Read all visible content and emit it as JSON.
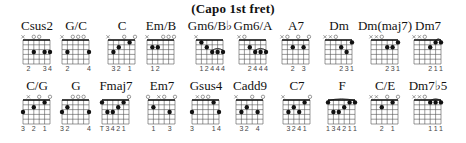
{
  "title": "(Capo 1st fret)",
  "layout": {
    "col_start_x": 16,
    "col_spacing": 33.6
  },
  "rows": [
    {
      "chords": [
        {
          "name": "Csus2",
          "top": [
            "x",
            "",
            "o",
            "o",
            "",
            ""
          ],
          "dots": [
            [
              2,
              3
            ],
            [
              4,
              3
            ],
            [
              5,
              3
            ]
          ],
          "barres": [],
          "fingers": [
            "",
            "2",
            "",
            "",
            "3",
            "4"
          ]
        },
        {
          "name": "G/C",
          "top": [
            "x",
            "",
            "o",
            "o",
            "o",
            ""
          ],
          "dots": [
            [
              1,
              3
            ],
            [
              5,
              3
            ]
          ],
          "barres": [],
          "fingers": [
            "",
            "2",
            "",
            "",
            "",
            "4"
          ]
        },
        {
          "name": "C",
          "top": [
            "x",
            "",
            "",
            "o",
            "",
            "o"
          ],
          "dots": [
            [
              1,
              3
            ],
            [
              2,
              2
            ],
            [
              4,
              1
            ]
          ],
          "barres": [],
          "fingers": [
            "",
            "3",
            "2",
            "",
            "1",
            ""
          ]
        },
        {
          "name": "Em/B",
          "top": [
            "x",
            "",
            "",
            "o",
            "o",
            "o"
          ],
          "dots": [
            [
              1,
              2
            ],
            [
              2,
              2
            ]
          ],
          "barres": [],
          "fingers": [
            "",
            "1",
            "2",
            "",
            "",
            ""
          ]
        },
        {
          "name": "Gm6/B♭",
          "top": [
            "x",
            "",
            "",
            "",
            "",
            ""
          ],
          "dots": [
            [
              1,
              1
            ],
            [
              2,
              2
            ],
            [
              3,
              3
            ],
            [
              4,
              3
            ],
            [
              5,
              3
            ]
          ],
          "barres": [
            [
              3,
              5,
              3
            ]
          ],
          "fingers": [
            "",
            "1",
            "2",
            "4",
            "4",
            "4"
          ]
        },
        {
          "name": "Gm6/A",
          "top": [
            "x",
            "o",
            "",
            "",
            "",
            ""
          ],
          "dots": [
            [
              2,
              2
            ],
            [
              3,
              3
            ],
            [
              4,
              3
            ],
            [
              5,
              3
            ]
          ],
          "barres": [
            [
              3,
              5,
              3
            ]
          ],
          "fingers": [
            "",
            "",
            "2",
            "4",
            "4",
            "4"
          ]
        },
        {
          "name": "A7",
          "top": [
            "x",
            "o",
            "",
            "o",
            "",
            "o"
          ],
          "dots": [
            [
              2,
              2
            ],
            [
              4,
              2
            ]
          ],
          "barres": [],
          "fingers": [
            "",
            "",
            "2",
            "",
            "3",
            ""
          ]
        },
        {
          "name": "Dm",
          "top": [
            "x",
            "x",
            "o",
            "",
            "",
            ""
          ],
          "dots": [
            [
              3,
              2
            ],
            [
              4,
              3
            ],
            [
              5,
              1
            ]
          ],
          "barres": [],
          "fingers": [
            "",
            "",
            "",
            "2",
            "3",
            "1"
          ]
        },
        {
          "name": "Dm(maj7)",
          "top": [
            "x",
            "x",
            "o",
            "",
            "",
            ""
          ],
          "dots": [
            [
              3,
              2
            ],
            [
              4,
              2
            ],
            [
              5,
              1
            ]
          ],
          "barres": [],
          "fingers": [
            "",
            "",
            "",
            "2",
            "3",
            "1"
          ]
        },
        {
          "name": "Dm7",
          "top": [
            "x",
            "x",
            "o",
            "",
            "",
            ""
          ],
          "dots": [
            [
              3,
              2
            ],
            [
              4,
              1
            ],
            [
              5,
              1
            ]
          ],
          "barres": [
            [
              4,
              5,
              1
            ]
          ],
          "fingers": [
            "",
            "",
            "",
            "2",
            "1",
            "1"
          ]
        }
      ]
    },
    {
      "chords": [
        {
          "name": "C/G",
          "top": [
            "",
            "x",
            "",
            "o",
            "",
            "o"
          ],
          "dots": [
            [
              0,
              3
            ],
            [
              2,
              2
            ],
            [
              4,
              1
            ]
          ],
          "barres": [],
          "fingers": [
            "3",
            "",
            "2",
            "",
            "1",
            ""
          ]
        },
        {
          "name": "G",
          "top": [
            "",
            "",
            "o",
            "o",
            "o",
            ""
          ],
          "dots": [
            [
              0,
              3
            ],
            [
              1,
              2
            ],
            [
              5,
              3
            ]
          ],
          "barres": [],
          "fingers": [
            "3",
            "2",
            "",
            "",
            "",
            "4"
          ]
        },
        {
          "name": "Fmaj7",
          "top": [
            "",
            "",
            "",
            "",
            "",
            "o"
          ],
          "dots": [
            [
              0,
              1
            ],
            [
              1,
              3
            ],
            [
              2,
              3
            ],
            [
              3,
              2
            ],
            [
              4,
              1
            ]
          ],
          "barres": [],
          "fingers": [
            "T",
            "3",
            "4",
            "2",
            "1",
            ""
          ]
        },
        {
          "name": "Em7",
          "top": [
            "o",
            "",
            "x",
            "o",
            "",
            "o"
          ],
          "dots": [
            [
              1,
              2
            ],
            [
              4,
              3
            ]
          ],
          "barres": [],
          "fingers": [
            "",
            "1",
            "",
            "",
            "3",
            ""
          ]
        },
        {
          "name": "Gsus4",
          "top": [
            "",
            "x",
            "o",
            "o",
            "",
            ""
          ],
          "dots": [
            [
              0,
              3
            ],
            [
              4,
              1
            ],
            [
              5,
              3
            ]
          ],
          "barres": [],
          "fingers": [
            "3",
            "",
            "",
            "",
            "1",
            "4"
          ]
        },
        {
          "name": "Cadd9",
          "top": [
            "x",
            "",
            "",
            "o",
            "",
            "o"
          ],
          "dots": [
            [
              1,
              3
            ],
            [
              2,
              2
            ],
            [
              4,
              3
            ]
          ],
          "barres": [],
          "fingers": [
            "",
            "3",
            "2",
            "",
            "4",
            ""
          ]
        },
        {
          "name": "C7",
          "top": [
            "x",
            "",
            "",
            "",
            "",
            "o"
          ],
          "dots": [
            [
              1,
              3
            ],
            [
              2,
              2
            ],
            [
              3,
              3
            ],
            [
              4,
              1
            ]
          ],
          "barres": [],
          "fingers": [
            "",
            "3",
            "2",
            "4",
            "1",
            ""
          ]
        },
        {
          "name": "F",
          "top": [
            "",
            "",
            "",
            "",
            "",
            ""
          ],
          "dots": [
            [
              0,
              1
            ],
            [
              1,
              3
            ],
            [
              2,
              3
            ],
            [
              3,
              2
            ],
            [
              4,
              1
            ],
            [
              5,
              1
            ]
          ],
          "barres": [
            [
              0,
              5,
              1
            ]
          ],
          "fingers": [
            "1",
            "3",
            "4",
            "2",
            "1",
            "1"
          ]
        },
        {
          "name": "C/E",
          "top": [
            "x",
            "x",
            "",
            "o",
            "",
            "o"
          ],
          "dots": [
            [
              2,
              2
            ],
            [
              4,
              1
            ]
          ],
          "barres": [],
          "fingers": [
            "",
            "",
            "2",
            "",
            "1",
            ""
          ]
        },
        {
          "name": "Dm7♭5",
          "top": [
            "x",
            "x",
            "o",
            "",
            "",
            ""
          ],
          "dots": [
            [
              3,
              1
            ],
            [
              4,
              1
            ],
            [
              5,
              1
            ]
          ],
          "barres": [
            [
              3,
              5,
              1
            ]
          ],
          "fingers": [
            "",
            "",
            "",
            "1",
            "1",
            "1"
          ]
        }
      ]
    }
  ],
  "colors": {
    "ink": "#111111",
    "grid": "#555555",
    "dot": "#111111",
    "finger_text": "#444444"
  }
}
